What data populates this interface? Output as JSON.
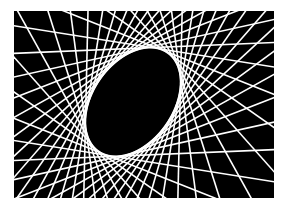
{
  "image": {
    "description": "Line envelope art: straight white lines tangent to a tilted ellipse on a black rectangle",
    "background_color": "#ffffff",
    "panel_color": "#000000",
    "line_color": "#ffffff"
  },
  "panel": {
    "x": 14,
    "y": 11,
    "width": 260,
    "height": 187
  },
  "ellipse": {
    "cx": 133,
    "cy": 102,
    "rx": 60,
    "ry": 40,
    "rotation_deg": -55
  },
  "lines": {
    "count": 40,
    "stroke_width": 1.6
  }
}
